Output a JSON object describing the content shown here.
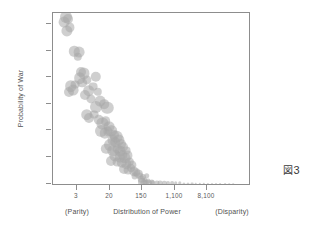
{
  "figure": {
    "caption_glyph": "図",
    "caption_number": "3"
  },
  "chart_data": {
    "type": "scatter",
    "title": "",
    "xlabel": "Distribution of Power",
    "ylabel": "Probability of War",
    "xlabel_left_annotation": "(Parity)",
    "xlabel_right_annotation": "(Disparity)",
    "xscale": "log",
    "yscale": "linear",
    "grid": false,
    "legend": "none",
    "bubble_color": "#a8a8a8",
    "bubble_opacity": 0.55,
    "frame_color": "#8d8d8d",
    "xticks": [
      {
        "value": 3,
        "label": "3",
        "px": 76
      },
      {
        "value": 20,
        "label": "20",
        "px": 109
      },
      {
        "value": 150,
        "label": "150",
        "px": 141
      },
      {
        "value": 1100,
        "label": "1,100",
        "px": 174
      },
      {
        "value": 8100,
        "label": "8,100",
        "px": 206
      }
    ],
    "yticks": [
      {
        "value": 0.0,
        "label": "0.000",
        "px": 183
      },
      {
        "value": 0.002,
        "label": "0.002",
        "px": 156
      },
      {
        "value": 0.004,
        "label": "0.004",
        "px": 129
      },
      {
        "value": 0.006,
        "label": "0.006",
        "px": 103
      },
      {
        "value": 0.008,
        "label": "0.008",
        "px": 76
      },
      {
        "value": 0.01,
        "label": "0.010",
        "px": 50
      },
      {
        "value": 0.012,
        "label": "0.012",
        "px": 23
      }
    ],
    "xlim": [
      1.1,
      60000
    ],
    "ylim": [
      0.0,
      0.0129
    ],
    "note": "Bubble area encodes observation weight; x is power-ratio on a log scale, y is predicted probability of war.",
    "points": [
      {
        "x": 1.55,
        "y": 0.01255,
        "r": 6.0
      },
      {
        "x": 1.4,
        "y": 0.01215,
        "r": 5.4
      },
      {
        "x": 1.75,
        "y": 0.0124,
        "r": 5.0
      },
      {
        "x": 1.62,
        "y": 0.0115,
        "r": 5.6
      },
      {
        "x": 1.95,
        "y": 0.01175,
        "r": 4.6
      },
      {
        "x": 2.55,
        "y": 0.00995,
        "r": 5.2
      },
      {
        "x": 3.35,
        "y": 0.0099,
        "r": 5.4
      },
      {
        "x": 3.1,
        "y": 0.00955,
        "r": 4.2
      },
      {
        "x": 3.85,
        "y": 0.00838,
        "r": 5.0
      },
      {
        "x": 4.55,
        "y": 0.0083,
        "r": 5.6
      },
      {
        "x": 3.55,
        "y": 0.00795,
        "r": 5.8
      },
      {
        "x": 4.1,
        "y": 0.0076,
        "r": 4.8
      },
      {
        "x": 2.05,
        "y": 0.00735,
        "r": 5.8
      },
      {
        "x": 2.35,
        "y": 0.00705,
        "r": 5.4
      },
      {
        "x": 1.85,
        "y": 0.0069,
        "r": 5.0
      },
      {
        "x": 2.7,
        "y": 0.00745,
        "r": 4.4
      },
      {
        "x": 5.6,
        "y": 0.00782,
        "r": 4.6
      },
      {
        "x": 9.3,
        "y": 0.00805,
        "r": 5.2
      },
      {
        "x": 8.1,
        "y": 0.0073,
        "r": 4.4
      },
      {
        "x": 6.1,
        "y": 0.007,
        "r": 5.8
      },
      {
        "x": 5.0,
        "y": 0.00665,
        "r": 5.0
      },
      {
        "x": 7.1,
        "y": 0.0064,
        "r": 4.6
      },
      {
        "x": 10.5,
        "y": 0.0069,
        "r": 4.2
      },
      {
        "x": 12.5,
        "y": 0.0062,
        "r": 5.4
      },
      {
        "x": 9.8,
        "y": 0.0058,
        "r": 6.0
      },
      {
        "x": 15.5,
        "y": 0.006,
        "r": 4.8
      },
      {
        "x": 19.0,
        "y": 0.0057,
        "r": 6.2
      },
      {
        "x": 5.4,
        "y": 0.0052,
        "r": 5.8
      },
      {
        "x": 6.4,
        "y": 0.00495,
        "r": 5.0
      },
      {
        "x": 8.5,
        "y": 0.0052,
        "r": 4.4
      },
      {
        "x": 11.5,
        "y": 0.0048,
        "r": 5.2
      },
      {
        "x": 14.0,
        "y": 0.00455,
        "r": 5.6
      },
      {
        "x": 17.0,
        "y": 0.0047,
        "r": 4.8
      },
      {
        "x": 21.0,
        "y": 0.0043,
        "r": 5.4
      },
      {
        "x": 13.0,
        "y": 0.004,
        "r": 6.0
      },
      {
        "x": 16.0,
        "y": 0.0038,
        "r": 5.2
      },
      {
        "x": 19.5,
        "y": 0.00395,
        "r": 4.6
      },
      {
        "x": 24.0,
        "y": 0.004,
        "r": 5.8
      },
      {
        "x": 28.0,
        "y": 0.0037,
        "r": 5.0
      },
      {
        "x": 33.0,
        "y": 0.00355,
        "r": 6.2
      },
      {
        "x": 26.0,
        "y": 0.0033,
        "r": 5.4
      },
      {
        "x": 31.0,
        "y": 0.00315,
        "r": 4.8
      },
      {
        "x": 38.0,
        "y": 0.0033,
        "r": 5.6
      },
      {
        "x": 44.0,
        "y": 0.003,
        "r": 5.0
      },
      {
        "x": 22.0,
        "y": 0.0029,
        "r": 6.0
      },
      {
        "x": 18.0,
        "y": 0.00265,
        "r": 5.2
      },
      {
        "x": 27.0,
        "y": 0.0025,
        "r": 5.8
      },
      {
        "x": 35.0,
        "y": 0.00265,
        "r": 4.6
      },
      {
        "x": 42.0,
        "y": 0.00245,
        "r": 5.4
      },
      {
        "x": 50.0,
        "y": 0.00275,
        "r": 5.0
      },
      {
        "x": 58.0,
        "y": 0.0025,
        "r": 4.4
      },
      {
        "x": 30.0,
        "y": 0.00215,
        "r": 5.6
      },
      {
        "x": 40.0,
        "y": 0.002,
        "r": 5.2
      },
      {
        "x": 48.0,
        "y": 0.00215,
        "r": 4.8
      },
      {
        "x": 56.0,
        "y": 0.00195,
        "r": 5.4
      },
      {
        "x": 66.0,
        "y": 0.00215,
        "r": 4.6
      },
      {
        "x": 23.0,
        "y": 0.00175,
        "r": 5.0
      },
      {
        "x": 34.0,
        "y": 0.00165,
        "r": 4.4
      },
      {
        "x": 45.0,
        "y": 0.0016,
        "r": 5.2
      },
      {
        "x": 60.0,
        "y": 0.0015,
        "r": 4.8
      },
      {
        "x": 72.0,
        "y": 0.00165,
        "r": 4.2
      },
      {
        "x": 85.0,
        "y": 0.00145,
        "r": 4.6
      },
      {
        "x": 52.0,
        "y": 0.00115,
        "r": 5.0
      },
      {
        "x": 68.0,
        "y": 0.00105,
        "r": 4.4
      },
      {
        "x": 80.0,
        "y": 0.0012,
        "r": 4.0
      },
      {
        "x": 95.0,
        "y": 0.00095,
        "r": 4.6
      },
      {
        "x": 110.0,
        "y": 0.0009,
        "r": 3.8
      },
      {
        "x": 125.0,
        "y": 0.00075,
        "r": 4.2
      },
      {
        "x": 100.0,
        "y": 0.00062,
        "r": 3.4
      },
      {
        "x": 140.0,
        "y": 0.00058,
        "r": 3.6
      },
      {
        "x": 165.0,
        "y": 0.00052,
        "r": 3.0
      },
      {
        "x": 210.0,
        "y": 0.00062,
        "r": 2.8
      },
      {
        "x": 150.0,
        "y": 0.00035,
        "r": 3.2
      },
      {
        "x": 185.0,
        "y": 0.0003,
        "r": 2.6
      },
      {
        "x": 230.0,
        "y": 0.00024,
        "r": 2.4
      },
      {
        "x": 280.0,
        "y": 0.00018,
        "r": 2.6
      },
      {
        "x": 155.0,
        "y": 0.00012,
        "r": 4.0
      },
      {
        "x": 175.0,
        "y": 0.0001,
        "r": 3.6
      },
      {
        "x": 200.0,
        "y": 9e-05,
        "r": 3.2
      },
      {
        "x": 240.0,
        "y": 8e-05,
        "r": 3.0
      },
      {
        "x": 300.0,
        "y": 7e-05,
        "r": 2.8
      },
      {
        "x": 380.0,
        "y": 6e-05,
        "r": 2.6
      },
      {
        "x": 470.0,
        "y": 6e-05,
        "r": 2.4
      },
      {
        "x": 600.0,
        "y": 5e-05,
        "r": 2.2
      },
      {
        "x": 760.0,
        "y": 5e-05,
        "r": 2.0
      },
      {
        "x": 950.0,
        "y": 4e-05,
        "r": 1.9
      },
      {
        "x": 1200.0,
        "y": 4e-05,
        "r": 1.8
      },
      {
        "x": 1550.0,
        "y": 4e-05,
        "r": 1.7
      },
      {
        "x": 1950.0,
        "y": 3e-05,
        "r": 1.6
      },
      {
        "x": 2500.0,
        "y": 3e-05,
        "r": 1.5
      },
      {
        "x": 3200.0,
        "y": 3e-05,
        "r": 1.4
      },
      {
        "x": 4100.0,
        "y": 3e-05,
        "r": 1.3
      },
      {
        "x": 5200.0,
        "y": 2e-05,
        "r": 1.2
      },
      {
        "x": 6600.0,
        "y": 2e-05,
        "r": 1.2
      },
      {
        "x": 8400.0,
        "y": 2e-05,
        "r": 1.1
      },
      {
        "x": 11000.0,
        "y": 2e-05,
        "r": 1.0
      },
      {
        "x": 14000.0,
        "y": 2e-05,
        "r": 1.0
      },
      {
        "x": 18000.0,
        "y": 2e-05,
        "r": 0.9
      },
      {
        "x": 24000.0,
        "y": 1e-05,
        "r": 0.9
      },
      {
        "x": 31000.0,
        "y": 1e-05,
        "r": 0.8
      },
      {
        "x": 40000.0,
        "y": 1e-05,
        "r": 0.8
      }
    ]
  }
}
